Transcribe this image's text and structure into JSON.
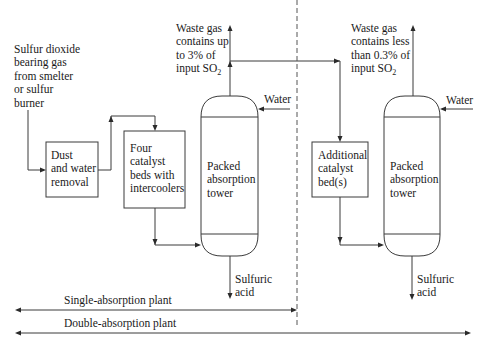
{
  "diagram": {
    "type": "process-flow",
    "source_label": [
      "Sulfur dioxide",
      "bearing gas",
      "from smelter",
      "or sulfur",
      "burner"
    ],
    "units": {
      "dust_removal": [
        "Dust",
        "and water",
        "removal"
      ],
      "catalyst_beds": [
        "Four",
        "catalyst",
        "beds with",
        "intercoolers"
      ],
      "tower_1": [
        "Packed",
        "absorption",
        "tower"
      ],
      "additional_catalyst": [
        "Additional",
        "catalyst",
        "bed(s)"
      ],
      "tower_2": [
        "Packed",
        "absorption",
        "tower"
      ]
    },
    "waste_gas_1": [
      "Waste gas",
      "contains up",
      "to 3% of",
      "input SO",
      "2"
    ],
    "waste_gas_2": [
      "Waste gas",
      "contains less",
      "than 0.3% of",
      "input SO",
      "2"
    ],
    "water_1": "Water",
    "water_2": "Water",
    "acid_1": [
      "Sulfuric",
      "acid"
    ],
    "acid_2": [
      "Sulfuric",
      "acid"
    ],
    "spans": {
      "single": "Single-absorption plant",
      "double": "Double-absorption plant"
    },
    "colors": {
      "line": "#3a3a3a",
      "text": "#1a1a1a",
      "background": "#ffffff"
    }
  }
}
